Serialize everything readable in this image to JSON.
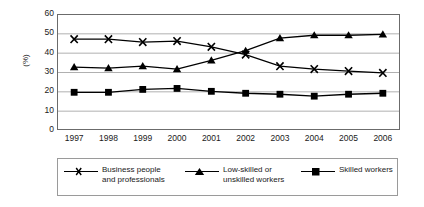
{
  "chart_data": {
    "type": "line",
    "title": "",
    "xlabel": "",
    "ylabel": "(%)",
    "categories": [
      "1997",
      "1998",
      "1999",
      "2000",
      "2001",
      "2002",
      "2003",
      "2004",
      "2005",
      "2006"
    ],
    "ylim": [
      0,
      60
    ],
    "yticks": [
      0,
      10,
      20,
      30,
      40,
      50,
      60
    ],
    "ytick_labels": [
      "0",
      "10",
      "20",
      "30",
      "40",
      "50",
      "60"
    ],
    "grid": "horizontal",
    "legend_position": "bottom",
    "series": [
      {
        "name": "Business people and professionals",
        "legend_line1": "Business people",
        "legend_line2": "and professionals",
        "marker": "x-marker",
        "color": "#000000",
        "values": [
          47,
          47,
          45.5,
          46,
          43,
          39,
          33,
          31.5,
          30.5,
          29.5
        ]
      },
      {
        "name": "Low-skilled or unskilled workers",
        "legend_line1": "Low-skilled or",
        "legend_line2": "unskilled workers",
        "marker": "triangle-marker",
        "color": "#000000",
        "values": [
          32.5,
          32,
          33,
          31.5,
          36,
          41,
          47.5,
          49,
          49,
          49.5
        ]
      },
      {
        "name": "Skilled workers",
        "legend_line1": "Skilled workers",
        "legend_line2": "",
        "marker": "square-marker",
        "color": "#000000",
        "values": [
          19.5,
          19.5,
          21,
          21.5,
          20,
          19,
          18.5,
          17.5,
          18.5,
          19
        ]
      }
    ]
  },
  "colors": {
    "axis": "#6b6b6b",
    "grid": "#b0b0b0",
    "series": "#000000",
    "background": "#ffffff",
    "legend_border": "#9a9a9a"
  }
}
